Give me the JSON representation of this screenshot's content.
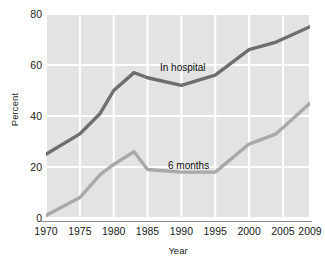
{
  "chart_data": {
    "type": "line",
    "title": "",
    "xlabel": "Year",
    "ylabel": "Percent",
    "xlim": [
      1970,
      2009
    ],
    "ylim": [
      0,
      80
    ],
    "grid": true,
    "legend_position": "inline-annotation",
    "y_ticks": [
      0,
      20,
      40,
      60,
      80
    ],
    "x_ticks": [
      1970,
      1975,
      1980,
      1985,
      1990,
      1995,
      2000,
      2005,
      2009
    ],
    "y_tick_labels": [
      "0",
      "20",
      "40",
      "60",
      "80"
    ],
    "x_tick_labels": [
      "1970",
      "1975",
      "1980",
      "1985",
      "1990",
      "1995",
      "2000",
      "2005",
      "2009"
    ],
    "x": [
      1970,
      1975,
      1978,
      1980,
      1983,
      1985,
      1990,
      1995,
      2000,
      2004,
      2009
    ],
    "series": [
      {
        "name": "In hospital",
        "color": "#6e6e6e",
        "values": [
          25,
          33,
          41,
          50,
          57,
          55,
          52,
          56,
          66,
          69,
          75
        ]
      },
      {
        "name": "6 months",
        "color": "#a9a9a9",
        "values": [
          1,
          8,
          17,
          21,
          26,
          19,
          18,
          18,
          29,
          33,
          45
        ]
      }
    ],
    "plot_background": "#e3e3e3",
    "gridline_color": "#ffffff",
    "axis_line_color": "#8d8d8d"
  }
}
